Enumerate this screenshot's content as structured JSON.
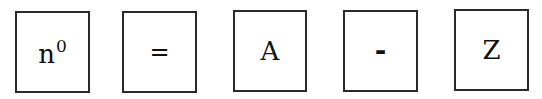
{
  "diagram": {
    "type": "symbol-sequence",
    "boxes": [
      {
        "base": "n",
        "superscript": "0"
      },
      {
        "symbol": "="
      },
      {
        "symbol": "A"
      },
      {
        "symbol": "-"
      },
      {
        "symbol": "Z"
      }
    ]
  },
  "colors": {
    "border": "#2a2a2a",
    "text": "#111111",
    "background": "#ffffff"
  }
}
